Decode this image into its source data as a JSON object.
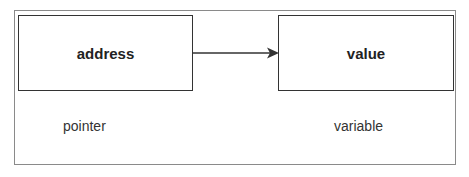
{
  "diagram": {
    "nodes": [
      {
        "id": "pointer-box",
        "text": "address",
        "caption": "pointer"
      },
      {
        "id": "variable-box",
        "text": "value",
        "caption": "variable"
      }
    ],
    "edges": [
      {
        "from": "pointer-box",
        "to": "variable-box",
        "style": "arrow"
      }
    ],
    "colors": {
      "border": "#333333",
      "frame": "#8a8a8a",
      "text": "#222222"
    }
  }
}
